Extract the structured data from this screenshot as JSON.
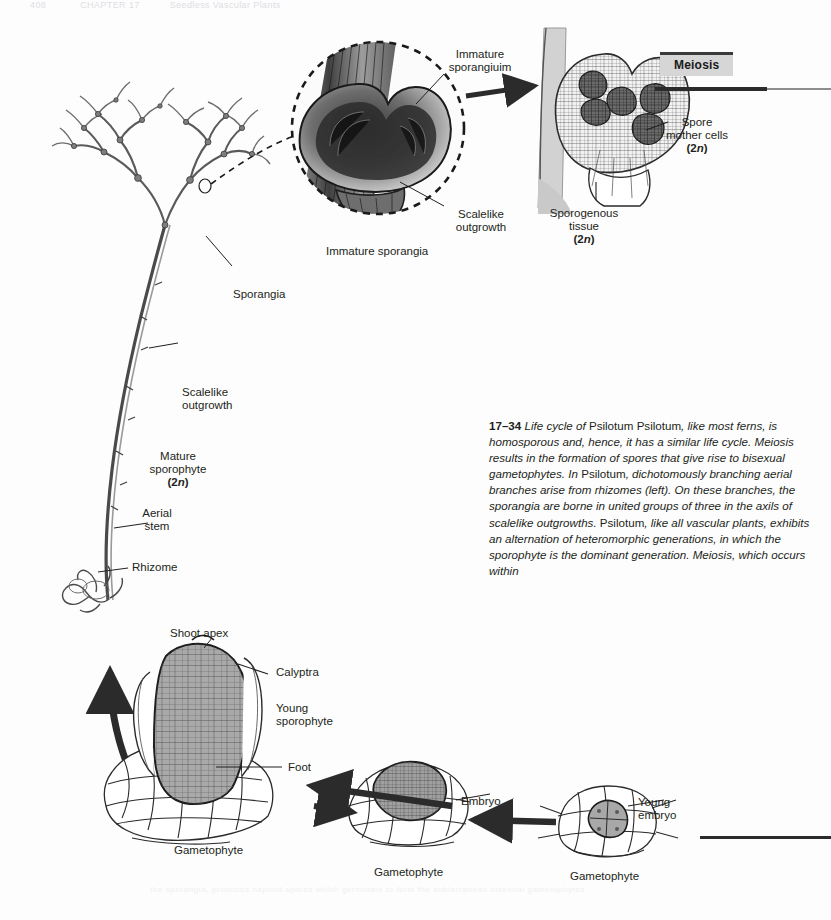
{
  "page": {
    "width": 831,
    "height": 920,
    "background": "#fdfdfd",
    "ink": "#231f20",
    "running_head_number": "408",
    "running_head_chapter": "CHAPTER 17",
    "running_head_title": "Seedless Vascular Plants"
  },
  "figure": {
    "number": "17–34",
    "title_plain_1": "Life cycle of ",
    "title_roman": "Psilotum",
    "meiosis_tag": "Meiosis",
    "caption_runs": [
      {
        "style": "fignum",
        "text": "17–34"
      },
      {
        "style": "italic",
        "text": "  Life cycle of "
      },
      {
        "style": "roman",
        "text": "Psilotum"
      },
      {
        "style": "italic",
        "text": "  "
      },
      {
        "style": "roman",
        "text": "Psilotum"
      },
      {
        "style": "italic",
        "text": ", like most ferns, is homosporous and, hence, it has a similar life cycle. Meiosis results in the formation of spores that give rise to bisexual gametophytes. In "
      },
      {
        "style": "roman",
        "text": "Psilotum"
      },
      {
        "style": "italic",
        "text": ", dichotomously branching aerial branches arise from rhizomes (left). On these branches, the sporangia are borne in united groups of three in the axils of scalelike outgrowths. "
      },
      {
        "style": "roman",
        "text": "Psilotum"
      },
      {
        "style": "italic",
        "text": ", like all vascular plants, exhibits an alternation of heteromorphic generations, in which the sporophyte is the dominant generation. Meiosis, which occurs within"
      }
    ]
  },
  "labels": {
    "immature_sporangium": "Immature\nsporangiuim",
    "immature_sporangia": "Immature sporangia",
    "scalelike_outgrowth_inset": "Scalelike\noutgrowth",
    "spore_mother_cells": "Spore\nmother cells",
    "spore_mother_cells_ploidy": "(2n)",
    "sporogenous_tissue": "Sporogenous\ntissue",
    "sporogenous_tissue_ploidy": "(2n)",
    "sporangia": "Sporangia",
    "scalelike_outgrowth_stem": "Scalelike\noutgrowth",
    "mature_sporophyte": "Mature\nsporophyte",
    "mature_sporophyte_ploidy": "(2n)",
    "aerial_stem": "Aerial\nstem",
    "rhizome": "Rhizome",
    "shoot_apex": "Shoot apex",
    "calyptra": "Calyptra",
    "young_sporophyte": "Young\nsporophyte",
    "foot": "Foot",
    "gametophyte_left": "Gametophyte",
    "embryo": "Embryo",
    "gametophyte_middle": "Gametophyte",
    "young_embryo": "Young\nembryo",
    "gametophyte_right": "Gametophyte"
  },
  "bleed_text": "the sporangia, produces haploid spores which germinate to form the subterranean bisexual gametophytes"
}
